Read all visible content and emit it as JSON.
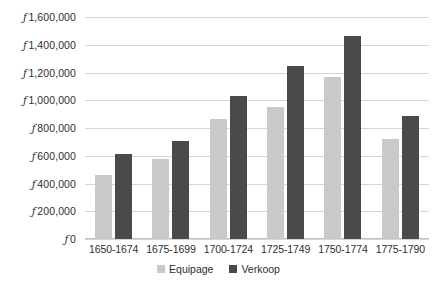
{
  "chart_data": {
    "type": "bar",
    "title": "",
    "subtitle": "",
    "xlabel": "",
    "ylabel": "",
    "categories": [
      "1650-1674",
      "1675-1699",
      "1700-1724",
      "1725-1749",
      "1750-1774",
      "1775-1790"
    ],
    "series": [
      {
        "name": "Equipage",
        "color": "#c9c9c9",
        "values": [
          460000,
          580000,
          865000,
          950000,
          1170000,
          720000
        ]
      },
      {
        "name": "Verkoop",
        "color": "#4a4a4a",
        "values": [
          615000,
          710000,
          1030000,
          1250000,
          1465000,
          885000
        ]
      }
    ],
    "ylim": [
      0,
      1600000
    ],
    "ytick_values": [
      0,
      200000,
      400000,
      600000,
      800000,
      1000000,
      1200000,
      1400000,
      1600000
    ],
    "ytick_labels": [
      "ƒ 0",
      "ƒ 200,000",
      "ƒ 400,000",
      "ƒ 600,000",
      "ƒ 800,000",
      "ƒ 1,000,000",
      "ƒ 1,200,000",
      "ƒ 1,400,000",
      "ƒ 1,600,000"
    ],
    "currency_symbol": "ƒ",
    "grid": true,
    "grid_axis": "y",
    "legend_position": "bottom",
    "background_color": "#ffffff",
    "gridline_color": "#d6d6d6"
  }
}
